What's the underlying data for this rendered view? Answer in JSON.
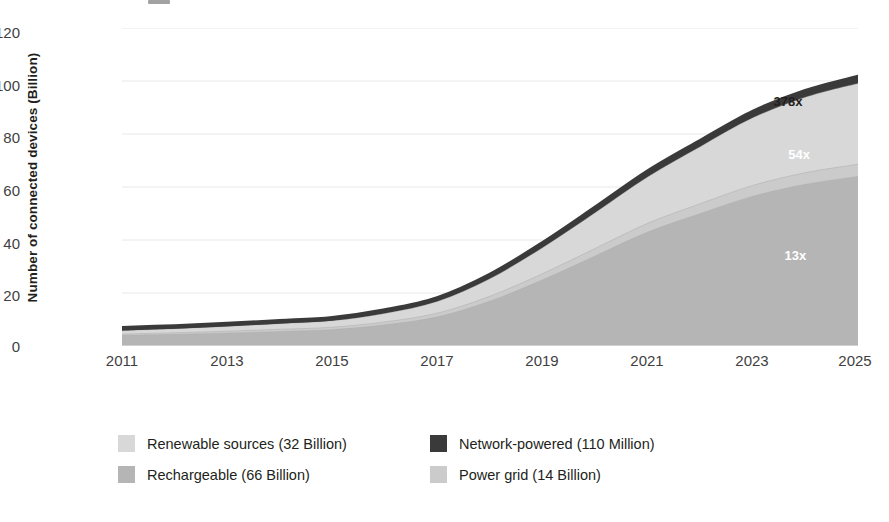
{
  "chart_data": {
    "type": "area",
    "title": "",
    "subtitle": "",
    "xlabel": "",
    "ylabel": "Number of connected devices (Billion)",
    "stacked": true,
    "grid": true,
    "legend_position": "bottom",
    "xlim": [
      2011,
      2025
    ],
    "ylim": [
      0,
      120
    ],
    "x": [
      2011,
      2012,
      2013,
      2014,
      2015,
      2016,
      2017,
      2018,
      2019,
      2020,
      2021,
      2022,
      2023,
      2024,
      2025
    ],
    "xticks": [
      "2011",
      "2013",
      "2015",
      "2017",
      "2019",
      "2021",
      "2023",
      "2025"
    ],
    "yticks": [
      "0",
      "20",
      "40",
      "60",
      "80",
      "100",
      "120"
    ],
    "series": [
      {
        "name": "Rechargeable (66 Billion)",
        "short_name": "Rechargeable",
        "value_label": "66 Billion",
        "color": "#b5b5b5",
        "values": [
          4.0,
          4.4,
          4.9,
          5.5,
          6.2,
          8.0,
          11.0,
          17.0,
          25.0,
          34.0,
          43.0,
          50.0,
          56.5,
          61.0,
          64.0
        ]
      },
      {
        "name": "Power grid (14 Billion)",
        "short_name": "Power grid",
        "value_label": "14 Billion",
        "color": "#cbcbcb",
        "values": [
          0.5,
          0.6,
          0.7,
          0.8,
          0.9,
          1.1,
          1.4,
          1.8,
          2.3,
          2.8,
          3.3,
          3.7,
          4.1,
          4.4,
          4.6
        ]
      },
      {
        "name": "Renewable sources (32 Billion)",
        "short_name": "Renewable sources",
        "value_label": "32 Billion",
        "color": "#d8d8d8",
        "values": [
          1.3,
          1.5,
          1.8,
          2.1,
          2.4,
          3.2,
          4.4,
          6.6,
          9.8,
          13.5,
          17.5,
          21.5,
          25.5,
          28.5,
          30.5
        ]
      },
      {
        "name": "Network-powered (110 Million)",
        "short_name": "Network-powered",
        "value_label": "110 Million",
        "color": "#3a3a3a",
        "values": [
          0.9,
          0.9,
          0.9,
          0.9,
          1.0,
          1.1,
          1.2,
          1.4,
          1.6,
          1.8,
          2.0,
          2.1,
          2.2,
          2.3,
          2.4
        ]
      }
    ],
    "totals": [
      6.7,
      7.4,
      8.3,
      9.3,
      10.5,
      13.4,
      18.0,
      26.8,
      38.7,
      52.1,
      65.8,
      77.3,
      88.3,
      96.2,
      101.5
    ],
    "annotations": [
      {
        "text": "378x",
        "style": "dark",
        "x_pct": 90.5,
        "y_pct": 23.0
      },
      {
        "text": "54x",
        "style": "light",
        "x_pct": 92.0,
        "y_pct": 39.5
      },
      {
        "text": "13x",
        "style": "light",
        "x_pct": 91.5,
        "y_pct": 71.5
      }
    ]
  },
  "legend": {
    "rows": [
      {
        "left": {
          "label": "Renewable sources (32 Billion)",
          "color": "#d8d8d8"
        },
        "right": {
          "label": "Network-powered (110 Million)",
          "color": "#3a3a3a"
        }
      },
      {
        "left": {
          "label": "Rechargeable (66 Billion)",
          "color": "#b5b5b5"
        },
        "right": {
          "label": "Power grid (14 Billion)",
          "color": "#cbcbcb"
        }
      }
    ]
  },
  "axis": {
    "y_title": "Number of connected devices (Billion)",
    "y_ticks": [
      "120",
      "100",
      "80",
      "60",
      "40",
      "20",
      "0"
    ],
    "x_ticks": [
      "2011",
      "2013",
      "2015",
      "2017",
      "2019",
      "2021",
      "2023",
      "2025"
    ]
  }
}
